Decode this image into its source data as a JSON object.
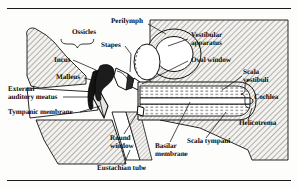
{
  "figure": {
    "frame": {
      "top_rule": "horizontal-rule",
      "bottom_rule": "horizontal-rule"
    },
    "colors": {
      "ink": "#0a0a0a",
      "line": "#1a1a1a",
      "hatch": "#6b6b6b",
      "bone_fill": "#f2f0ec",
      "fluid_fill": "#ffffff",
      "background": "#fdfdfb"
    },
    "labels": [
      {
        "id": "ossicles",
        "text": "Ossicles",
        "x": 85,
        "y": 30,
        "align": "center",
        "leader": "brace-down"
      },
      {
        "id": "perilymph",
        "text": "Perilymph",
        "x": 110,
        "y": 19,
        "align": "left",
        "leader": "line"
      },
      {
        "id": "stapes",
        "text": "Stapes",
        "x": 100,
        "y": 43,
        "align": "left",
        "leader": "line"
      },
      {
        "id": "incus",
        "text": "Incus",
        "x": 54,
        "y": 59,
        "align": "left",
        "leader": "line"
      },
      {
        "id": "malleus",
        "text": "Malleus",
        "x": 58,
        "y": 76,
        "align": "left",
        "leader": "line"
      },
      {
        "id": "external-auditory-meatus",
        "text": "External\nauditory meatus",
        "x": 8,
        "y": 88,
        "align": "left",
        "leader": "line"
      },
      {
        "id": "tympanic-membrane",
        "text": "Tympanic membrane",
        "x": 8,
        "y": 110,
        "align": "left",
        "leader": "line"
      },
      {
        "id": "eustachian-tube",
        "text": "Eustachian tube",
        "x": 97,
        "y": 166,
        "align": "left",
        "leader": "line"
      },
      {
        "id": "vestibular-apparatus",
        "text": "Vestibular\napparatus",
        "x": 190,
        "y": 33,
        "align": "left",
        "leader": "line"
      },
      {
        "id": "oval-window",
        "text": "Oval window",
        "x": 190,
        "y": 58,
        "align": "left",
        "leader": "line"
      },
      {
        "id": "scala-vestibuli",
        "text": "Scala\nvestibuli",
        "x": 243,
        "y": 70,
        "align": "left",
        "leader": "line"
      },
      {
        "id": "cochlea",
        "text": "Cochlea",
        "x": 255,
        "y": 97,
        "align": "left",
        "leader": "brace-left"
      },
      {
        "id": "helicotrema",
        "text": "Helicotrema",
        "x": 240,
        "y": 122,
        "align": "left",
        "leader": "line"
      },
      {
        "id": "scala-tympani",
        "text": "Scala tympani",
        "x": 188,
        "y": 140,
        "align": "left",
        "leader": "line"
      },
      {
        "id": "basilar-membrane",
        "text": "Basilar\nmembrane",
        "x": 155,
        "y": 145,
        "align": "left",
        "leader": "line"
      },
      {
        "id": "round-window",
        "text": "Round\nwindow",
        "x": 110,
        "y": 137,
        "align": "left",
        "leader": "line"
      }
    ]
  }
}
